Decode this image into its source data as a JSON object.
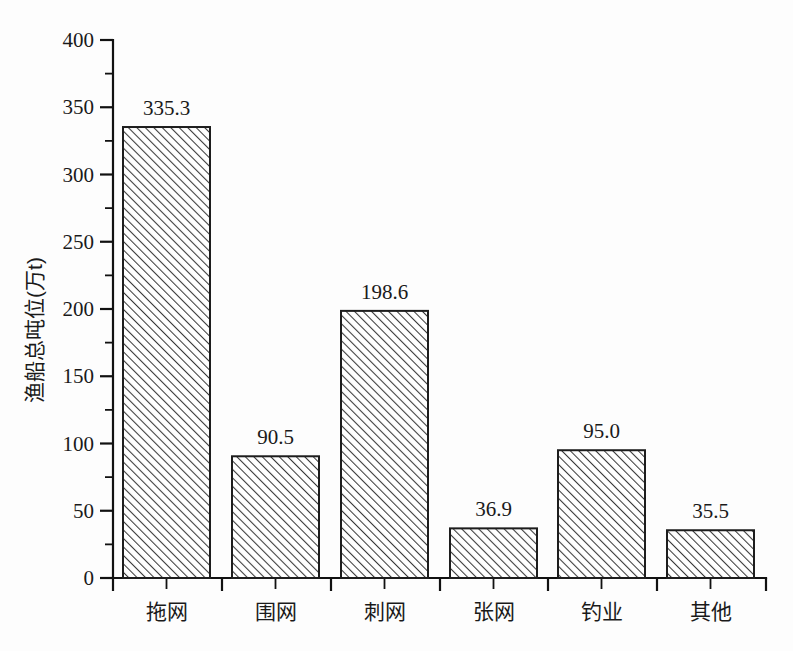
{
  "chart_data": {
    "type": "bar",
    "title": "",
    "subtitle": "",
    "xlabel": "",
    "ylabel": "渔船总吨位(万t)",
    "categories": [
      "拖网",
      "围网",
      "刺网",
      "张网",
      "钓业",
      "其他"
    ],
    "values": [
      335.3,
      90.5,
      198.6,
      36.9,
      95.0,
      35.5
    ],
    "value_labels": [
      "335.3",
      "90.5",
      "198.6",
      "36.9",
      "95.0",
      "35.5"
    ],
    "ylim": [
      0,
      400
    ],
    "y_ticks": [
      0,
      50,
      100,
      150,
      200,
      250,
      300,
      350,
      400
    ],
    "y_tick_labels": [
      "0",
      "50",
      "100",
      "150",
      "200",
      "250",
      "300",
      "350",
      "400"
    ],
    "y_minor_ticks": [
      25,
      75,
      125,
      175,
      225,
      275,
      325,
      375
    ],
    "grid": false,
    "legend": null,
    "legend_position": "none",
    "bar_fill": "hatch-diagonal-45",
    "bar_edge_color": "#1d1d1d",
    "background_color": "#fdfdfd",
    "axis_color": "#111111"
  },
  "axes": {
    "y_axis_title": "渔船总吨位(万t)",
    "x_axis_title": ""
  }
}
